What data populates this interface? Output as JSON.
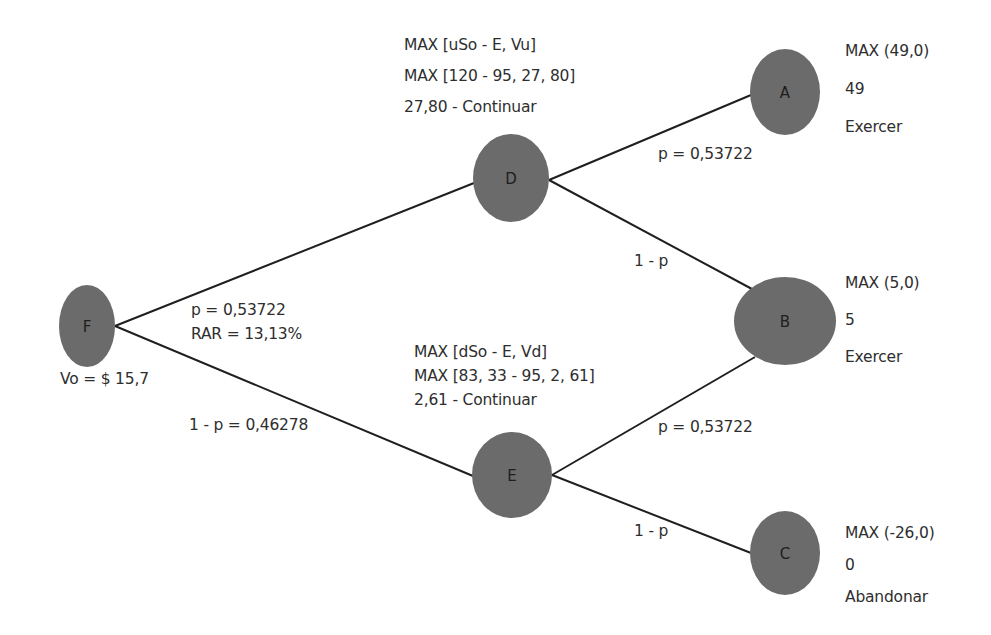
{
  "diagram": {
    "type": "binomial-decision-tree",
    "style": {
      "node_fill": "#6b6b6b",
      "edge_color": "#1f1f1f",
      "text_color": "#2e2e2e",
      "background": "#ffffff"
    },
    "nodes": {
      "F": {
        "label": "F",
        "value_text": "Vo = $ 15,7"
      },
      "D": {
        "label": "D",
        "lines": [
          "MAX [uSo - E, Vu]",
          "MAX [120 - 95, 27, 80]",
          "27,80 - Continuar"
        ]
      },
      "E": {
        "label": "E",
        "lines": [
          "MAX [dSo - E, Vd]",
          "MAX [83, 33 - 95, 2, 61]",
          "2,61 - Continuar"
        ]
      },
      "A": {
        "label": "A",
        "lines": [
          "MAX (49,0)",
          "49",
          "Exercer"
        ]
      },
      "B": {
        "label": "B",
        "lines": [
          "MAX (5,0)",
          "5",
          "Exercer"
        ]
      },
      "C": {
        "label": "C",
        "lines": [
          "MAX (-26,0)",
          "0",
          "Abandonar"
        ]
      }
    },
    "edges": [
      {
        "from": "F",
        "to": "D",
        "labels": [
          "p = 0,53722",
          "RAR = 13,13%"
        ]
      },
      {
        "from": "F",
        "to": "E",
        "labels": [
          "1 - p = 0,46278"
        ]
      },
      {
        "from": "D",
        "to": "A",
        "labels": [
          "p = 0,53722"
        ]
      },
      {
        "from": "D",
        "to": "B",
        "labels": [
          "1 - p"
        ]
      },
      {
        "from": "E",
        "to": "B",
        "labels": [
          "p = 0,53722"
        ]
      },
      {
        "from": "E",
        "to": "C",
        "labels": [
          "1 - p"
        ]
      }
    ]
  }
}
